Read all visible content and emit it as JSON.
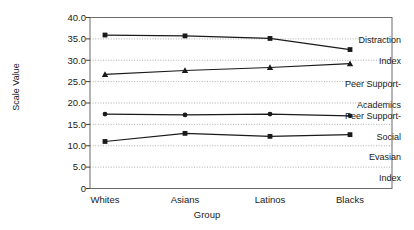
{
  "chart_data": {
    "type": "line",
    "title": "",
    "xlabel": "Group",
    "ylabel": "Scale Value",
    "categories": [
      "Whites",
      "Asians",
      "Latinos",
      "Blacks"
    ],
    "ylim": [
      0,
      40
    ],
    "yticks": [
      "0",
      "5.0",
      "10.0",
      "15.0",
      "20.0",
      "25.0",
      "30.0",
      "35.0",
      "40.0"
    ],
    "ytick_values": [
      0,
      5,
      10,
      15,
      20,
      25,
      30,
      35,
      40
    ],
    "grid": "horizontal-dotted",
    "legend_position": "inline-right",
    "series": [
      {
        "name": "Distraction Index",
        "label_line1": "Distraction",
        "label_line2": "Index",
        "marker": "square",
        "color": "#1a1a1a",
        "values": [
          35.9,
          35.7,
          35.1,
          32.5
        ]
      },
      {
        "name": "Peer Support-Academics",
        "label_line1": "Peer Support-",
        "label_line2": "Academics",
        "marker": "triangle",
        "color": "#1a1a1a",
        "values": [
          26.7,
          27.6,
          28.3,
          29.2
        ]
      },
      {
        "name": "Peer Support-Social",
        "label_line1": "Peer Support-",
        "label_line2": "Social",
        "marker": "circle",
        "color": "#1a1a1a",
        "values": [
          17.4,
          17.2,
          17.4,
          17.0
        ]
      },
      {
        "name": "Evasian Index",
        "label_line1": "Evasian",
        "label_line2": "Index",
        "marker": "square",
        "color": "#1a1a1a",
        "values": [
          11.0,
          12.9,
          12.2,
          12.6
        ]
      }
    ]
  }
}
